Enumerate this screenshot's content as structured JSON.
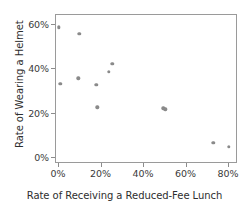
{
  "chart_data": {
    "type": "scatter",
    "title": "",
    "xlabel": "Rate of Receiving a Reduced-Fee Lunch",
    "ylabel": "Rate of Wearing a Helmet",
    "xlim": [
      -2,
      86
    ],
    "ylim": [
      -2,
      65
    ],
    "grid": false,
    "legend": null,
    "xticks": [
      0,
      20,
      40,
      60,
      80
    ],
    "xticklabels": [
      "0%",
      "20%",
      "40%",
      "60%",
      "80%"
    ],
    "yticks": [
      0,
      20,
      40,
      60
    ],
    "yticklabels": [
      "0%",
      "20%",
      "40%",
      "60%"
    ],
    "marker_color": "#8a8a8a",
    "axis_color": "#9a9a9a",
    "points": [
      {
        "x": 0.5,
        "y": 58.5
      },
      {
        "x": 1.0,
        "y": 33.0
      },
      {
        "x": 9.5,
        "y": 35.5
      },
      {
        "x": 10.0,
        "y": 55.5
      },
      {
        "x": 18.0,
        "y": 32.5
      },
      {
        "x": 18.5,
        "y": 22.5
      },
      {
        "x": 24.0,
        "y": 38.5
      },
      {
        "x": 25.5,
        "y": 42.0
      },
      {
        "x": 49.5,
        "y": 22.0
      },
      {
        "x": 50.5,
        "y": 21.5
      },
      {
        "x": 73.0,
        "y": 6.5
      },
      {
        "x": 80.5,
        "y": 4.5
      }
    ]
  }
}
